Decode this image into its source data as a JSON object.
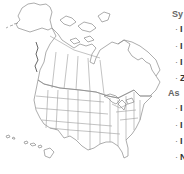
{
  "map": {
    "title": "North America range map",
    "regions": [
      "Alaska",
      "Canada",
      "Contiguous United States",
      "Hawaii",
      "Greenland (partial)"
    ],
    "outline_color": "#9a9a9a"
  },
  "legend": {
    "sections": [
      {
        "heading": "Sy",
        "items": [
          "I",
          "I",
          "I",
          "Z"
        ]
      },
      {
        "heading": "As",
        "items": [
          "I",
          "I",
          "I",
          "N"
        ]
      }
    ]
  }
}
